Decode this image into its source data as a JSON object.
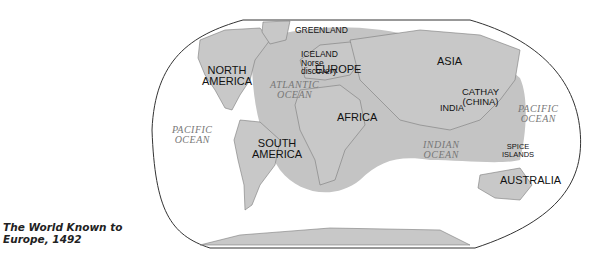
{
  "caption": {
    "line1": "The World Known to",
    "line2": "Europe, 1492"
  },
  "colors": {
    "land": "#c8c8c8",
    "known_world": "#c4c4c4",
    "coast": "#7a7a7a",
    "border": "#333333",
    "ocean_label": "#777777",
    "label": "#111111"
  },
  "labels": {
    "continents": {
      "north_america": [
        "NORTH",
        "AMERICA"
      ],
      "south_america": [
        "SOUTH",
        "AMERICA"
      ],
      "europe": "EUROPE",
      "africa": "AFRICA",
      "asia": "ASIA",
      "australia": "AUSTRALIA"
    },
    "regions": {
      "greenland": "GREENLAND",
      "iceland": [
        "ICELAND",
        "Norse",
        "discovery"
      ],
      "cathay": [
        "CATHAY",
        "(CHINA)"
      ],
      "india": "INDIA",
      "spice_islands": [
        "SPICE",
        "ISLANDS"
      ]
    },
    "oceans": {
      "atlantic": [
        "ATLANTIC",
        "OCEAN"
      ],
      "pacific_west": [
        "PACIFIC",
        "OCEAN"
      ],
      "pacific_east": [
        "PACIFIC",
        "OCEAN"
      ],
      "indian": [
        "INDIAN",
        "OCEAN"
      ]
    }
  }
}
